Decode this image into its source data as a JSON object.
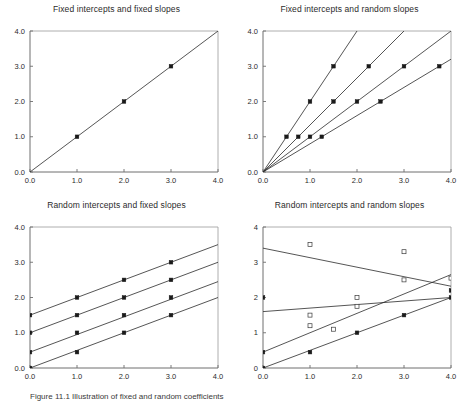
{
  "figure": {
    "caption": "Figure 11.1  Illustration of fixed and random coefficients",
    "panel_count": 4
  },
  "chart_data": [
    {
      "id": "fixed-intercepts-fixed-slopes",
      "position": "top-left",
      "type": "line",
      "title": "Fixed intercepts and fixed slopes",
      "xlabel": "",
      "ylabel": "",
      "xlim": [
        0,
        4
      ],
      "ylim": [
        0,
        4
      ],
      "xticks": [
        0,
        1,
        2,
        3,
        4
      ],
      "yticks": [
        0,
        1,
        2,
        3,
        4
      ],
      "xticklabels": [
        "0.0",
        "1.0",
        "2.0",
        "3.0",
        "4.0"
      ],
      "yticklabels": [
        "0.0",
        "1.0",
        "2.0",
        "3.0",
        "4.0"
      ],
      "grid": false,
      "legend": "none",
      "series": [
        {
          "name": "line-1",
          "intercept": 0.0,
          "slope": 1.0,
          "line": [
            [
              0,
              0
            ],
            [
              4,
              4
            ]
          ],
          "markers": [
            [
              1,
              1
            ],
            [
              2,
              2
            ],
            [
              3,
              3
            ]
          ],
          "marker_style": "filled-square"
        }
      ]
    },
    {
      "id": "fixed-intercepts-random-slopes",
      "position": "top-right",
      "type": "line",
      "title": "Fixed intercepts and random slopes",
      "xlabel": "",
      "ylabel": "",
      "xlim": [
        0,
        4
      ],
      "ylim": [
        0,
        4
      ],
      "xticks": [
        0,
        1,
        2,
        3,
        4
      ],
      "yticks": [
        0,
        1,
        2,
        3,
        4
      ],
      "xticklabels": [
        "0.0",
        "1.0",
        "2.0",
        "3.0",
        "4.0"
      ],
      "yticklabels": [
        "0.0",
        "1.0",
        "2.0",
        "3.0",
        "4.0"
      ],
      "grid": false,
      "legend": "none",
      "series": [
        {
          "name": "line-1",
          "intercept": 0.0,
          "slope": 2.0,
          "line": [
            [
              0,
              0
            ],
            [
              2.0,
              4
            ]
          ],
          "markers": [
            [
              0.5,
              1
            ],
            [
              1.0,
              2
            ],
            [
              1.5,
              3
            ]
          ],
          "marker_style": "filled-square"
        },
        {
          "name": "line-2",
          "intercept": 0.0,
          "slope": 1.3333,
          "line": [
            [
              0,
              0
            ],
            [
              3.0,
              4
            ]
          ],
          "markers": [
            [
              0.75,
              1
            ],
            [
              1.5,
              2
            ],
            [
              2.25,
              3
            ]
          ],
          "marker_style": "filled-square"
        },
        {
          "name": "line-3",
          "intercept": 0.0,
          "slope": 1.0,
          "line": [
            [
              0,
              0
            ],
            [
              4,
              4
            ]
          ],
          "markers": [
            [
              1.0,
              1
            ],
            [
              2.0,
              2
            ],
            [
              3.0,
              3
            ]
          ],
          "marker_style": "filled-square"
        },
        {
          "name": "line-4",
          "intercept": 0.0,
          "slope": 0.8,
          "line": [
            [
              0,
              0
            ],
            [
              4,
              3.2
            ]
          ],
          "markers": [
            [
              1.25,
              1
            ],
            [
              2.5,
              2
            ],
            [
              3.75,
              3
            ]
          ],
          "marker_style": "filled-square"
        }
      ]
    },
    {
      "id": "random-intercepts-fixed-slopes",
      "position": "bottom-left",
      "type": "line",
      "title": "Random intercepts and fixed slopes",
      "xlabel": "",
      "ylabel": "",
      "xlim": [
        0,
        4
      ],
      "ylim": [
        0,
        4
      ],
      "xticks": [
        0,
        1,
        2,
        3,
        4
      ],
      "yticks": [
        0,
        1,
        2,
        3,
        4
      ],
      "xticklabels": [
        "0.0",
        "1.0",
        "2.0",
        "3.0",
        "4.0"
      ],
      "yticklabels": [
        "0.0",
        "1.0",
        "2.0",
        "3.0",
        "4.0"
      ],
      "grid": false,
      "legend": "none",
      "series": [
        {
          "name": "line-1",
          "intercept": 1.5,
          "slope": 0.5,
          "line": [
            [
              0,
              1.5
            ],
            [
              4,
              3.5
            ]
          ],
          "markers": [
            [
              0,
              1.5
            ],
            [
              1,
              2.0
            ],
            [
              2,
              2.5
            ],
            [
              3,
              3.0
            ]
          ],
          "marker_style": "filled-square"
        },
        {
          "name": "line-2",
          "intercept": 1.0,
          "slope": 0.5,
          "line": [
            [
              0,
              1.0
            ],
            [
              4,
              3.0
            ]
          ],
          "markers": [
            [
              0,
              1.0
            ],
            [
              1,
              1.5
            ],
            [
              2,
              2.0
            ],
            [
              3,
              2.5
            ]
          ],
          "marker_style": "filled-square"
        },
        {
          "name": "line-3",
          "intercept": 0.45,
          "slope": 0.5,
          "line": [
            [
              0,
              0.45
            ],
            [
              4,
              2.45
            ]
          ],
          "markers": [
            [
              0,
              0.45
            ],
            [
              1,
              1.0
            ],
            [
              2,
              1.5
            ],
            [
              3,
              2.0
            ]
          ],
          "marker_style": "filled-square"
        },
        {
          "name": "line-4",
          "intercept": 0.0,
          "slope": 0.5,
          "line": [
            [
              0,
              0.0
            ],
            [
              4,
              2.0
            ]
          ],
          "markers": [
            [
              0,
              0.0
            ],
            [
              1,
              0.45
            ],
            [
              2,
              1.0
            ],
            [
              3,
              1.5
            ]
          ],
          "marker_style": "filled-square"
        }
      ]
    },
    {
      "id": "random-intercepts-random-slopes",
      "position": "bottom-right",
      "type": "scatter-line",
      "title": "Random intercepts and random slopes",
      "xlabel": "",
      "ylabel": "",
      "xlim": [
        0,
        4
      ],
      "ylim": [
        0,
        4
      ],
      "xticks": [
        0,
        1,
        2,
        3,
        4
      ],
      "yticks": [
        0,
        1,
        2,
        3,
        4
      ],
      "xticklabels": [
        "0.0",
        "1.0",
        "2.0",
        "3.0",
        "4.0"
      ],
      "yticklabels": [
        "0",
        "1",
        "2",
        "3",
        "4"
      ],
      "grid": false,
      "legend": "none",
      "series": [
        {
          "name": "line-1",
          "intercept": 3.4,
          "slope": -0.27,
          "line": [
            [
              0,
              3.4
            ],
            [
              4,
              2.32
            ]
          ],
          "markers": [],
          "marker_style": "none"
        },
        {
          "name": "line-2",
          "intercept": 1.6,
          "slope": 0.1,
          "line": [
            [
              0,
              1.6
            ],
            [
              4,
              2.0
            ]
          ],
          "markers": [],
          "marker_style": "none"
        },
        {
          "name": "line-3",
          "intercept": 0.45,
          "slope": 0.55,
          "line": [
            [
              0,
              0.45
            ],
            [
              4,
              2.65
            ]
          ],
          "markers": [],
          "marker_style": "none"
        },
        {
          "name": "line-4",
          "intercept": 0.0,
          "slope": 0.5,
          "line": [
            [
              0,
              0.0
            ],
            [
              4,
              2.0
            ]
          ],
          "markers": [],
          "marker_style": "none"
        }
      ],
      "points_filled": [
        [
          0,
          2.0
        ],
        [
          0,
          0.45
        ],
        [
          0,
          0.0
        ],
        [
          1,
          0.45
        ],
        [
          2,
          1.0
        ],
        [
          3,
          1.5
        ],
        [
          4,
          2.2
        ],
        [
          4,
          2.0
        ]
      ],
      "points_open": [
        [
          1,
          3.5
        ],
        [
          1,
          1.5
        ],
        [
          1,
          1.2
        ],
        [
          1.5,
          1.1
        ],
        [
          2,
          2.0
        ],
        [
          2,
          1.75
        ],
        [
          3,
          3.3
        ],
        [
          3,
          2.5
        ],
        [
          4,
          2.55
        ]
      ]
    }
  ]
}
